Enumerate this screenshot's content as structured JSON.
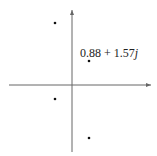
{
  "diagram": {
    "type": "complex-plane",
    "axes": {
      "color": "#555555"
    },
    "points": [
      {
        "name": "p1",
        "x": 55,
        "y": 23
      },
      {
        "name": "p2",
        "x": 89,
        "y": 61
      },
      {
        "name": "p3",
        "x": 55,
        "y": 99
      },
      {
        "name": "p4",
        "x": 89,
        "y": 138
      }
    ],
    "annotation": {
      "real": "0.88 + 1.57",
      "imag_unit": "j"
    }
  }
}
